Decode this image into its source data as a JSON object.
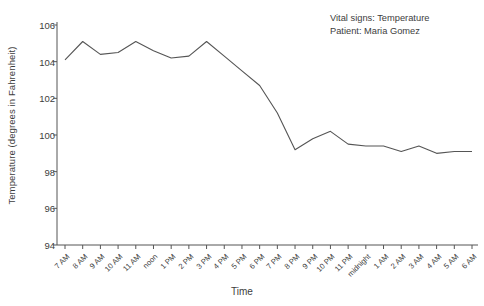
{
  "chart_data": {
    "type": "line",
    "title": "",
    "xlabel": "Time",
    "ylabel": "Temperature (degrees in Fahrenheit)",
    "ylim": [
      94,
      106
    ],
    "yticks": [
      94,
      96,
      98,
      100,
      102,
      104,
      106
    ],
    "grid": false,
    "legend": "none",
    "line_color": "#555555",
    "categories": [
      "7 AM",
      "8 AM",
      "9 AM",
      "10 AM",
      "11 AM",
      "noon",
      "1 PM",
      "2 PM",
      "3 PM",
      "4 PM",
      "5 PM",
      "6 PM",
      "7 PM",
      "8 PM",
      "9 PM",
      "10 PM",
      "11 PM",
      "midnight",
      "1 AM",
      "2 AM",
      "3 AM",
      "4 AM",
      "5 AM",
      "6 AM"
    ],
    "values": [
      104.1,
      105.1,
      104.4,
      104.5,
      105.1,
      104.6,
      104.2,
      104.3,
      105.1,
      104.3,
      103.5,
      102.7,
      101.2,
      99.2,
      99.8,
      100.2,
      99.5,
      99.4,
      99.4,
      99.1,
      99.4,
      99.0,
      99.1,
      99.1
    ],
    "annotations": [
      "Vital signs: Temperature",
      "Patient: Maria Gomez"
    ]
  }
}
